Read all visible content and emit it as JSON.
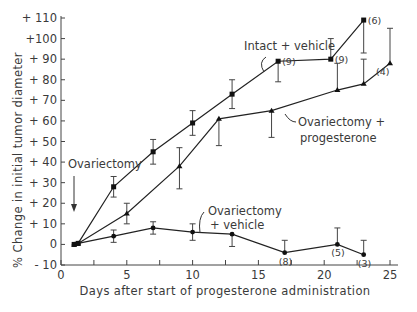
{
  "chart_data": {
    "type": "line",
    "title": "",
    "xlabel": "Days after start of progesterone administration",
    "ylabel": "% Change in initial tumor diameter",
    "xlim": [
      0,
      25
    ],
    "ylim": [
      -10,
      110
    ],
    "x_ticks": [
      0,
      5,
      10,
      15,
      20,
      25
    ],
    "y_ticks": [
      -10,
      0,
      10,
      20,
      30,
      40,
      50,
      60,
      70,
      80,
      90,
      100,
      110
    ],
    "y_tick_labels": [
      "- 10",
      "0",
      "+ 10",
      "+ 20",
      "+ 30",
      "+ 40",
      "+ 50",
      "+ 60",
      "+ 70",
      "+ 80",
      "+ 90",
      "+100",
      "+ 110"
    ],
    "grid": false,
    "legend": "inline annotations",
    "series": [
      {
        "name": "Intact + vehicle",
        "marker": "square",
        "x": [
          1,
          1.3,
          4,
          7,
          10,
          13,
          16.5,
          20.5,
          23
        ],
        "values": [
          0,
          0.5,
          28,
          45,
          59,
          73,
          89,
          90,
          109
        ],
        "err_up": [
          0,
          0,
          5,
          6,
          6,
          7,
          0,
          10,
          0
        ],
        "err_down": [
          0,
          0,
          5,
          6,
          6,
          7,
          10,
          0,
          16
        ],
        "n_labels": [
          {
            "x": 16.5,
            "label": "(9)"
          },
          {
            "x": 20.5,
            "label": "(9)"
          },
          {
            "x": 23,
            "label": "(6)"
          }
        ]
      },
      {
        "name": "Ovariectomy + progesterone",
        "marker": "triangle",
        "x": [
          1,
          1.3,
          5,
          9,
          12,
          16,
          21,
          23,
          25
        ],
        "values": [
          0,
          0.5,
          15,
          38,
          61,
          65,
          75,
          78,
          88
        ],
        "err_up": [
          0,
          0,
          5,
          9,
          0,
          0,
          13,
          12,
          17
        ],
        "err_down": [
          0,
          0,
          5,
          11,
          13,
          13,
          0,
          0,
          0
        ],
        "n_labels": [
          {
            "x": 25,
            "label": "(4)"
          }
        ]
      },
      {
        "name": "Ovariectomy + vehicle",
        "marker": "circle",
        "x": [
          1,
          1.3,
          4,
          7,
          10,
          13,
          17,
          21,
          23
        ],
        "values": [
          0,
          0.5,
          4,
          8,
          6,
          5,
          -4,
          0,
          -5
        ],
        "err_up": [
          0,
          0,
          3,
          3,
          4,
          0,
          6,
          8,
          7
        ],
        "err_down": [
          0,
          0,
          3,
          3,
          4,
          6,
          0,
          0,
          0
        ],
        "n_labels": [
          {
            "x": 17,
            "label": "(8)"
          },
          {
            "x": 21,
            "label": "(5)"
          },
          {
            "x": 23,
            "label": "(3)"
          }
        ]
      }
    ],
    "annotations": [
      {
        "text": "Ovariectomy",
        "arrow_to_x": 1,
        "arrow_to_y": 2
      },
      {
        "text": "Intact + vehicle"
      },
      {
        "text": "Ovariectomy +"
      },
      {
        "text": "progesterone"
      },
      {
        "text": "Ovariectomy"
      },
      {
        "text": "+ vehicle"
      }
    ]
  },
  "labels": {
    "ylabel": "% Change in initial tumor diameter",
    "xlabel": "Days after start of progesterone administration",
    "anno_ovx": "Ovariectomy",
    "anno_intact": "Intact + vehicle",
    "anno_op1": "Ovariectomy +",
    "anno_op2": "progesterone",
    "anno_ov1": "Ovariectomy",
    "anno_ov2": "+ vehicle"
  }
}
